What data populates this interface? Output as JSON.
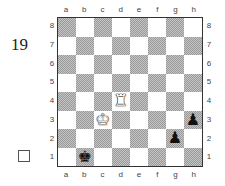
{
  "puzzle": {
    "number": "19",
    "checkbox_symbol": "empty-square"
  },
  "board": {
    "files": [
      "a",
      "b",
      "c",
      "d",
      "e",
      "f",
      "g",
      "h"
    ],
    "ranks": [
      "8",
      "7",
      "6",
      "5",
      "4",
      "3",
      "2",
      "1"
    ],
    "light_color": "#ffffff",
    "dark_color": "#b0b0b0",
    "pieces": [
      {
        "square": "d4",
        "type": "rook",
        "color": "white",
        "glyph": "♜"
      },
      {
        "square": "c3",
        "type": "king",
        "color": "white",
        "glyph": "♚"
      },
      {
        "square": "b1",
        "type": "king",
        "color": "black",
        "glyph": "♚"
      },
      {
        "square": "h3",
        "type": "pawn",
        "color": "black",
        "glyph": "♟"
      },
      {
        "square": "g2",
        "type": "pawn",
        "color": "black",
        "glyph": "♟"
      }
    ]
  }
}
